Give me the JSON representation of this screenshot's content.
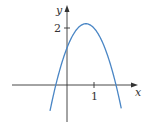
{
  "chart_data": {
    "type": "line",
    "title": "",
    "xlabel": "x",
    "ylabel": "y",
    "x_ticks": [
      {
        "value": 1,
        "label": "1"
      }
    ],
    "y_ticks": [
      {
        "value": 2,
        "label": "2"
      }
    ],
    "grid": false,
    "legend": null,
    "xlim": [
      -1.1,
      2.6
    ],
    "ylim": [
      -1.3,
      2.9
    ],
    "series": [
      {
        "name": "parabola",
        "color": "#4a86c5",
        "description": "downward-opening parabola, vertex ≈ (0.7, 2.15), y-intercept ≈ 1.3, roots ≈ -0.4 and 1.8",
        "x": [
          -0.6,
          -0.4,
          -0.2,
          0.0,
          0.2,
          0.4,
          0.6,
          0.7,
          0.8,
          1.0,
          1.2,
          1.4,
          1.6,
          1.8,
          2.0
        ],
        "y": [
          -0.77,
          0.06,
          0.75,
          1.3,
          1.72,
          1.99,
          2.13,
          2.15,
          2.13,
          1.99,
          1.72,
          1.3,
          0.75,
          0.06,
          -0.77
        ]
      }
    ]
  },
  "axes": {
    "x_label": "x",
    "y_label": "y",
    "x_tick_label": "1",
    "y_tick_label": "2",
    "axis_color": "#333333",
    "curve_color": "#4a86c5"
  }
}
